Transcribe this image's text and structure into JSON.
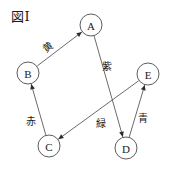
{
  "figure": {
    "title": "図Ⅰ",
    "width": 172,
    "height": 170,
    "background": "#ffffff",
    "ink_color": "#4a4a4a",
    "text_color": "#1a1a1a"
  },
  "chart_data": {
    "type": "diagram",
    "diagram_kind": "directed-graph",
    "title": "図Ⅰ",
    "nodes": [
      {
        "id": "A",
        "label": "A",
        "x": 91,
        "y": 25,
        "r": 11
      },
      {
        "id": "B",
        "label": "B",
        "x": 28,
        "y": 73,
        "r": 11
      },
      {
        "id": "C",
        "label": "C",
        "x": 49,
        "y": 146,
        "r": 11
      },
      {
        "id": "D",
        "label": "D",
        "x": 126,
        "y": 148,
        "r": 11
      },
      {
        "id": "E",
        "label": "E",
        "x": 148,
        "y": 74,
        "r": 11
      }
    ],
    "edges": [
      {
        "id": "edge-b-a",
        "from": "B",
        "to": "A",
        "label": "黄",
        "label_meaning": "yellow",
        "label_x": 48,
        "label_y": 47,
        "label_rotation": -37,
        "directed": true
      },
      {
        "id": "edge-a-d",
        "from": "A",
        "to": "D",
        "label": "紫",
        "label_meaning": "purple",
        "label_x": 107,
        "label_y": 66,
        "label_rotation": 0,
        "directed": true
      },
      {
        "id": "edge-c-b",
        "from": "C",
        "to": "B",
        "label": "赤",
        "label_meaning": "red",
        "label_x": 31,
        "label_y": 121,
        "label_rotation": 0,
        "directed": true
      },
      {
        "id": "edge-e-c",
        "from": "E",
        "to": "C",
        "label": "緑",
        "label_meaning": "green",
        "label_x": 101,
        "label_y": 123,
        "label_rotation": 0,
        "directed": true
      },
      {
        "id": "edge-d-e",
        "from": "D",
        "to": "E",
        "label": "青",
        "label_meaning": "blue",
        "label_x": 143,
        "label_y": 118,
        "label_rotation": 0,
        "directed": true
      }
    ]
  }
}
